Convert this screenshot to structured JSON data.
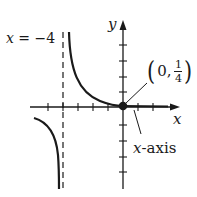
{
  "figure": {
    "asymptote_label": "x = −4",
    "asymptote_label_parts": {
      "var": "x",
      "rest": " = −4"
    },
    "y_axis_label": "y",
    "x_axis_label": "x",
    "x_axis_callout": {
      "var": "x",
      "rest": "-axis"
    },
    "point_label": {
      "open": "(",
      "x": "0,",
      "num": "1",
      "den": "4",
      "close": ")"
    },
    "point": [
      0,
      0.25
    ],
    "asymptote_x": -4,
    "horizontal_asymptote": "x-axis (y = 0)",
    "colors": {
      "stroke": "#1a1a1a",
      "background": "#ffffff"
    }
  }
}
